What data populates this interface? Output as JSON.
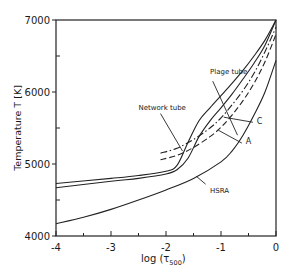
{
  "chart_data": {
    "type": "line",
    "title": "",
    "xlabel": "log (τ500)",
    "xlabel_main": "log (τ",
    "xlabel_sub": "500",
    "xlabel_close": ")",
    "ylabel": "Temperature  T  [K]",
    "xlim": [
      -4,
      0
    ],
    "ylim": [
      4000,
      7000
    ],
    "xticks": [
      -4,
      -3,
      -2,
      -1,
      0
    ],
    "xtick_labels": [
      "-4",
      "-3",
      "-2",
      "-1",
      "0"
    ],
    "yticks": [
      4000,
      5000,
      6000,
      7000
    ],
    "ytick_labels": [
      "4000",
      "5000",
      "6000",
      "7000"
    ],
    "grid": false,
    "legend": "none (inline annotations)",
    "series": [
      {
        "name": "Plage tube",
        "style": "solid",
        "x": [
          -4.0,
          -3.0,
          -2.5,
          -2.0,
          -1.8,
          -1.6,
          -1.4,
          -1.2,
          -1.0,
          -0.8,
          -0.6,
          -0.4,
          -0.2,
          0.0
        ],
        "y": [
          4730,
          4800,
          4840,
          4900,
          4980,
          5300,
          5600,
          5780,
          5950,
          6120,
          6300,
          6500,
          6720,
          7000
        ]
      },
      {
        "name": "Network tube",
        "style": "solid",
        "x": [
          -4.0,
          -3.0,
          -2.5,
          -2.0,
          -1.8,
          -1.6,
          -1.4,
          -1.2,
          -1.0,
          -0.8,
          -0.6,
          -0.4,
          -0.2,
          0.0
        ],
        "y": [
          4670,
          4760,
          4800,
          4860,
          4920,
          5080,
          5380,
          5600,
          5780,
          5970,
          6180,
          6400,
          6650,
          7000
        ]
      },
      {
        "name": "C",
        "style": "dash-dot",
        "x": [
          -2.1,
          -1.8,
          -1.5,
          -1.2,
          -1.0,
          -0.8,
          -0.6,
          -0.4,
          -0.2,
          0.0
        ],
        "y": [
          5150,
          5220,
          5340,
          5500,
          5640,
          5820,
          6020,
          6260,
          6560,
          6900
        ]
      },
      {
        "name": "A",
        "style": "dashed",
        "x": [
          -2.1,
          -1.8,
          -1.5,
          -1.2,
          -1.0,
          -0.8,
          -0.6,
          -0.4,
          -0.2,
          0.0
        ],
        "y": [
          5060,
          5120,
          5230,
          5380,
          5510,
          5680,
          5880,
          6120,
          6420,
          6800
        ]
      },
      {
        "name": "HSRA",
        "style": "solid",
        "x": [
          -4.0,
          -3.5,
          -3.0,
          -2.5,
          -2.0,
          -1.5,
          -1.0,
          -0.8,
          -0.6,
          -0.4,
          -0.2,
          0.0
        ],
        "y": [
          4170,
          4260,
          4370,
          4500,
          4640,
          4800,
          5030,
          5180,
          5400,
          5680,
          6000,
          6440
        ]
      }
    ],
    "annotations": [
      {
        "text": "Plage tube",
        "x": -1.2,
        "y": 6250
      },
      {
        "text": "Network tube",
        "x": -2.5,
        "y": 5750
      },
      {
        "text": "C",
        "x": -0.35,
        "y": 5550
      },
      {
        "text": "A",
        "x": -0.55,
        "y": 5280
      },
      {
        "text": "HSRA",
        "x": -1.2,
        "y": 4600
      }
    ]
  }
}
